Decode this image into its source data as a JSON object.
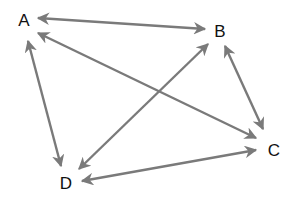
{
  "diagram": {
    "type": "directed-graph",
    "edge_color": "#7a7a7a",
    "label_color": "#111111",
    "nodes": [
      {
        "id": "A",
        "label": "A",
        "x": 24,
        "y": 26
      },
      {
        "id": "B",
        "label": "B",
        "x": 220,
        "y": 37
      },
      {
        "id": "C",
        "label": "C",
        "x": 274,
        "y": 156
      },
      {
        "id": "D",
        "label": "D",
        "x": 66,
        "y": 189
      }
    ],
    "edges": [
      {
        "from": "A",
        "to": "B",
        "bidirectional": true,
        "x1": 38,
        "y1": 18,
        "x2": 205,
        "y2": 29
      },
      {
        "from": "A",
        "to": "C",
        "bidirectional": true,
        "x1": 38,
        "y1": 33,
        "x2": 256,
        "y2": 138
      },
      {
        "from": "A",
        "to": "D",
        "bidirectional": true,
        "x1": 28,
        "y1": 41,
        "x2": 61,
        "y2": 166
      },
      {
        "from": "B",
        "to": "C",
        "bidirectional": true,
        "x1": 225,
        "y1": 46,
        "x2": 263,
        "y2": 129
      },
      {
        "from": "B",
        "to": "D",
        "bidirectional": true,
        "x1": 208,
        "y1": 44,
        "x2": 79,
        "y2": 169
      },
      {
        "from": "C",
        "to": "D",
        "bidirectional": true,
        "x1": 256,
        "y1": 150,
        "x2": 82,
        "y2": 181
      }
    ]
  }
}
